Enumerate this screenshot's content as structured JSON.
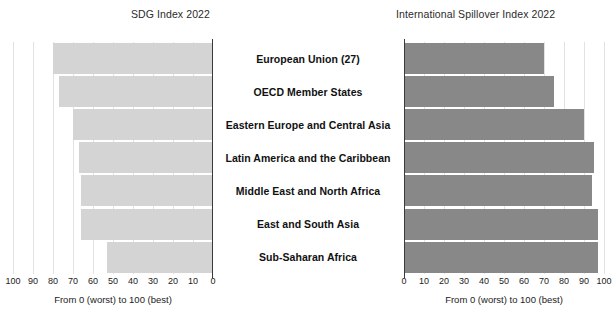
{
  "chart_data": [
    {
      "type": "bar",
      "orientation": "horizontal",
      "panel": "left",
      "title": "SDG Index 2022",
      "xlabel": "From 0 (worst) to 100 (best)",
      "ylabel": "",
      "xlim": [
        100,
        0
      ],
      "reversed_axis": true,
      "grid": true,
      "legend": "none",
      "bar_color": "#d4d4d4",
      "ticks": [
        "100",
        "90",
        "80",
        "70",
        "60",
        "50",
        "40",
        "30",
        "20",
        "10",
        "0"
      ],
      "tick_values": [
        100,
        90,
        80,
        70,
        60,
        50,
        40,
        30,
        20,
        10,
        0
      ],
      "categories": [
        "European Union (27)",
        "OECD Member States",
        "Eastern Europe and Central Asia",
        "Latin America and the Caribbean",
        "Middle East and North Africa",
        "East and South Asia",
        "Sub-Saharan Africa"
      ],
      "values": [
        80,
        77,
        70,
        67,
        66,
        66,
        53
      ]
    },
    {
      "type": "bar",
      "orientation": "horizontal",
      "panel": "right",
      "title": "International Spillover Index 2022",
      "xlabel": "From 0 (worst) to 100 (best)",
      "ylabel": "",
      "xlim": [
        0,
        100
      ],
      "reversed_axis": false,
      "grid": true,
      "legend": "none",
      "bar_color": "#888888",
      "ticks": [
        "0",
        "10",
        "20",
        "30",
        "40",
        "50",
        "60",
        "70",
        "80",
        "90",
        "100"
      ],
      "tick_values": [
        0,
        10,
        20,
        30,
        40,
        50,
        60,
        70,
        80,
        90,
        100
      ],
      "categories": [
        "European Union (27)",
        "OECD Member States",
        "Eastern Europe and Central Asia",
        "Latin America and the Caribbean",
        "Middle East and North Africa",
        "East and South Asia",
        "Sub-Saharan Africa"
      ],
      "values": [
        70,
        75,
        90,
        95,
        94,
        97,
        97
      ]
    }
  ],
  "left_chart": {
    "title": "SDG Index 2022",
    "caption": "From 0 (worst) to 100 (best)"
  },
  "right_chart": {
    "title": "International Spillover Index 2022",
    "caption": "From 0 (worst) to 100 (best)"
  }
}
